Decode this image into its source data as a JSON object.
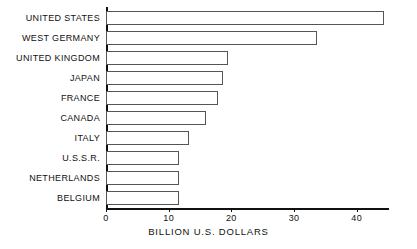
{
  "chart_data": {
    "type": "bar",
    "orientation": "horizontal",
    "title": "",
    "xlabel": "BILLION U.S. DOLLARS",
    "ylabel": "",
    "categories": [
      "UNITED STATES",
      "WEST GERMANY",
      "UNITED KINGDOM",
      "JAPAN",
      "FRANCE",
      "CANADA",
      "ITALY",
      "U.S.S.R.",
      "NETHERLANDS",
      "BELGIUM"
    ],
    "values": [
      44.4,
      33.7,
      19.4,
      18.7,
      17.8,
      16.0,
      13.3,
      11.7,
      11.7,
      11.7
    ],
    "xlim": [
      0,
      45
    ],
    "xticks": [
      0,
      10,
      20,
      30,
      40
    ],
    "xtick_labels": [
      "0",
      "10",
      "20",
      "30",
      "40"
    ],
    "grid": false,
    "legend": null,
    "bar_fill_color": "#ffffff",
    "bar_edge_color": "#555555",
    "axis_color": "#111111",
    "background_color": "#ffffff"
  }
}
